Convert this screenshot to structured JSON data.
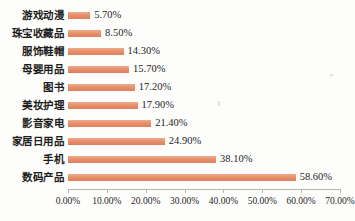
{
  "chart_data": {
    "type": "bar",
    "orientation": "horizontal",
    "title": "",
    "xlabel": "",
    "ylabel": "",
    "categories": [
      "游戏动漫",
      "珠宝收藏品",
      "服饰鞋帽",
      "母婴用品",
      "图书",
      "美妆护理",
      "影音家电",
      "家居日用品",
      "手机",
      "数码产品"
    ],
    "values": [
      5.7,
      8.5,
      14.3,
      15.7,
      17.2,
      17.9,
      21.4,
      24.9,
      38.1,
      58.6
    ],
    "value_labels": [
      "5.70%",
      "8.50%",
      "14.30%",
      "15.70%",
      "17.20%",
      "17.90%",
      "21.40%",
      "24.90%",
      "38.10%",
      "58.60%"
    ],
    "xlim": [
      0,
      70
    ],
    "xticks": [
      0,
      10,
      20,
      30,
      40,
      50,
      60,
      70
    ],
    "xtick_labels": [
      "0.00%",
      "10.00%",
      "20.00%",
      "30.00%",
      "40.00%",
      "50.00%",
      "60.00%",
      "70.00%"
    ],
    "grid": false,
    "legend": null,
    "bar_color": "#e8906c",
    "axis_color": "#b9b6b2",
    "background": "#fdfdfb"
  }
}
